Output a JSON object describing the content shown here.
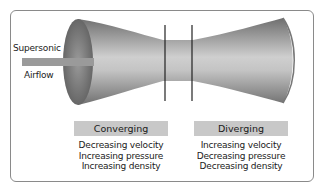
{
  "diagram": {
    "inlet_label_line1": "Supersonic",
    "inlet_label_line2": "Airflow",
    "sections": [
      {
        "title": "Converging",
        "properties": [
          "Decreasing velocity",
          "Increasing pressure",
          "Increasing density"
        ]
      },
      {
        "title": "Diverging",
        "properties": [
          "Increasing velocity",
          "Decreasing pressure",
          "Decreasing density"
        ]
      }
    ],
    "colors": {
      "nozzle_dark": "#6e6e6e",
      "nozzle_light": "#d4d4d4",
      "arrow": "#9a9a9a",
      "label_box": "#c8c8c8",
      "frame": "#8a8a8a"
    }
  }
}
